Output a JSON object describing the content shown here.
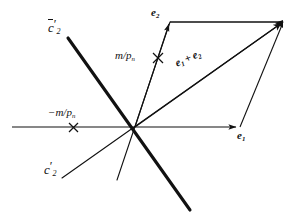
{
  "figure": {
    "type": "vector-parallelogram-diagram",
    "width": 293,
    "height": 224,
    "background_color": "#ffffff",
    "ink_color": "#111111"
  },
  "labels": {
    "c_bar_2_prime": {
      "base": "c",
      "prime": "′",
      "sub": "2",
      "overbar": true,
      "text": "c̄′2"
    },
    "c_2_prime": {
      "base": "c",
      "prime": "′",
      "sub": "2",
      "overbar": false,
      "text": "c′2"
    },
    "m_over_pn": {
      "text": "m/p",
      "sub": "n"
    },
    "neg_m_over_pn": {
      "text": "−m/p",
      "sub": "n"
    },
    "e2": {
      "base": "e",
      "sub": "2"
    },
    "e1": {
      "base": "e",
      "sub": "1"
    },
    "e1_plus_e2": {
      "base1": "e",
      "sub1": "1",
      "plus": "+",
      "base2": "e",
      "sub2": "2"
    }
  },
  "geometry": {
    "origin": {
      "x": 135,
      "y": 127
    },
    "horizontal_axis": {
      "x1": 12,
      "y1": 127,
      "x2": 238,
      "y2": 127,
      "arrow_end": true
    },
    "e2_vector": {
      "x1": 135,
      "y1": 127,
      "x2": 170,
      "y2": 22,
      "arrow_end": true
    },
    "diagonal_sum_vector": {
      "x1": 135,
      "y1": 127,
      "x2": 283,
      "y2": 22,
      "arrow_end": true
    },
    "parallelogram_top_edge": {
      "x1": 170,
      "y1": 22,
      "x2": 283,
      "y2": 22
    },
    "parallelogram_right_edge": {
      "x1": 240,
      "y1": 127,
      "x2": 283,
      "y2": 22
    },
    "c_bar_2_prime_line": {
      "x1": 68,
      "y1": 38,
      "x2": 190,
      "y2": 210,
      "width": 3
    },
    "c_2_prime_line": {
      "x1": 62,
      "y1": 178,
      "x2": 283,
      "y2": 22,
      "width": 1
    },
    "budget_line_steep": {
      "x1": 117,
      "y1": 180,
      "x2": 170,
      "y2": 22,
      "width": 1
    },
    "cross_mark_m_over_pn": {
      "x": 158,
      "y": 58,
      "size": 5
    },
    "cross_mark_neg_m_over_pn": {
      "x": 73,
      "y": 128,
      "size": 5
    }
  }
}
